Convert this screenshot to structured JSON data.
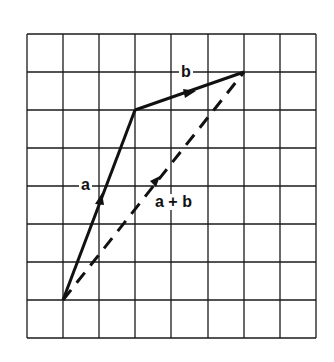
{
  "diagram": {
    "type": "vector-addition",
    "grid": {
      "columns": 8,
      "rows": 8,
      "left": 27,
      "top": 34,
      "cell_width": 36.1,
      "cell_height": 38,
      "line_color": "#1a1a1a"
    },
    "vectors": [
      {
        "name": "a",
        "label": "a",
        "from": [
          1,
          7
        ],
        "to": [
          3,
          2
        ],
        "style": "solid",
        "components": [
          2,
          5
        ]
      },
      {
        "name": "b",
        "label": "b",
        "from": [
          3,
          2
        ],
        "to": [
          6,
          1
        ],
        "style": "solid",
        "components": [
          3,
          1
        ]
      },
      {
        "name": "a+b",
        "label": "a + b",
        "from": [
          1,
          7
        ],
        "to": [
          6,
          1
        ],
        "style": "dashed",
        "components": [
          5,
          6
        ]
      }
    ],
    "labels": {
      "a": "a",
      "b": "b",
      "sum": "a + b"
    },
    "colors": {
      "vector": "#111111",
      "background": "#ffffff"
    }
  }
}
